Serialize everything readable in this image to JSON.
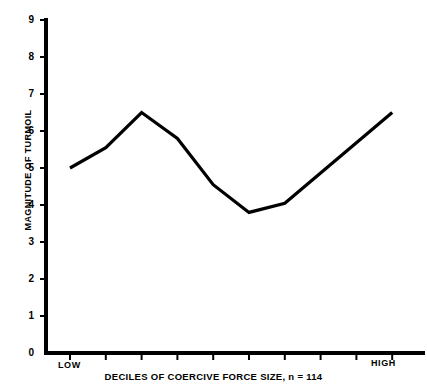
{
  "chart_data": {
    "type": "line",
    "title": "",
    "subtitle": "",
    "xlabel": "DECILES OF COERCIVE FORCE SIZE, n = 114",
    "ylabel": "MAGNITUDE OF TURMOIL",
    "xlim": [
      0.5,
      10.5
    ],
    "ylim": [
      0,
      9
    ],
    "grid": false,
    "legend": "none",
    "x_tick_labels": [
      "LOW",
      "",
      "",
      "",
      "",
      "",
      "",
      "",
      "",
      "HIGH"
    ],
    "x_low_label": "LOW",
    "x_high_label": "HIGH",
    "y_tick_labels": [
      "0",
      "1",
      "2",
      "3",
      "4",
      "5",
      "6",
      "7",
      "8",
      "9"
    ],
    "y_ticks": [
      0,
      1,
      2,
      3,
      4,
      5,
      6,
      7,
      8,
      9
    ],
    "sample_size": "n = 114",
    "categories": [
      1,
      2,
      3,
      4,
      5,
      6,
      7,
      8,
      9,
      10
    ],
    "series": [
      {
        "name": "Magnitude of turmoil",
        "color": "#000000",
        "x": [
          1,
          2,
          3,
          4,
          5,
          6,
          7,
          8,
          10
        ],
        "values": [
          5.0,
          5.55,
          6.5,
          5.8,
          4.55,
          3.8,
          4.05,
          4.75,
          6.5
        ]
      }
    ],
    "points": [
      {
        "x": 1,
        "y": 5.0
      },
      {
        "x": 2,
        "y": 5.55
      },
      {
        "x": 3,
        "y": 6.5
      },
      {
        "x": 4,
        "y": 5.8
      },
      {
        "x": 5,
        "y": 4.55
      },
      {
        "x": 6,
        "y": 3.8
      },
      {
        "x": 7,
        "y": 4.05
      },
      {
        "x": 10,
        "y": 6.5
      }
    ],
    "line_color": "#000000",
    "axis_color": "#000000",
    "background_color": "#ffffff"
  },
  "geometry": {
    "x_axis_px": {
      "x0": 70,
      "x1": 424,
      "y": 353,
      "tick_step": 35.8
    },
    "y_axis_px": {
      "x": 46,
      "y0": 353,
      "y1": 20,
      "unit": 37.0
    }
  }
}
